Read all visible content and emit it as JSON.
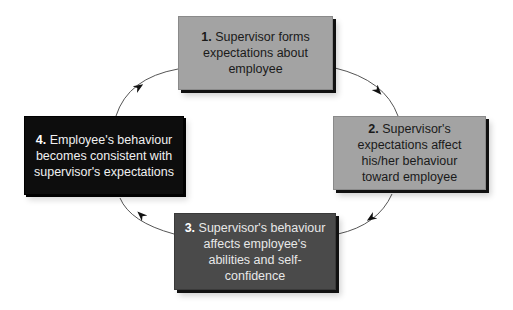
{
  "diagram": {
    "type": "cycle",
    "steps": [
      {
        "number": "1.",
        "text": "Supervisor forms expectations about employee",
        "fill": "#a3a3a3"
      },
      {
        "number": "2.",
        "text": "Supervisor's expectations affect his/her behaviour toward employee",
        "fill": "#a3a3a3"
      },
      {
        "number": "3.",
        "text": "Supervisor's behaviour affects employee's abilities and self-confidence",
        "fill": "#4a4a4a"
      },
      {
        "number": "4.",
        "text": "Employee's behaviour becomes consistent with supervisor's expectations",
        "fill": "#0d0d0d"
      }
    ],
    "connections": [
      {
        "from": 1,
        "to": 2
      },
      {
        "from": 2,
        "to": 3
      },
      {
        "from": 3,
        "to": 4
      },
      {
        "from": 4,
        "to": 1
      }
    ],
    "arrow_color": "#555555"
  }
}
